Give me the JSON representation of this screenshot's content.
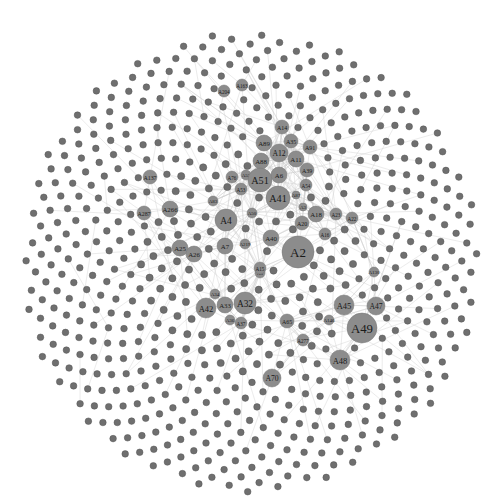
{
  "graph": {
    "type": "network",
    "background": "#ffffff",
    "node_color": "#8c8c8c",
    "small_node_color": "#6f6f6f",
    "edge_color": "#cfcfcf",
    "center": [
      250,
      262
    ],
    "outer_radius": 230,
    "labeled_nodes": [
      {
        "id": "A2",
        "x": 298,
        "y": 252,
        "r": 16
      },
      {
        "id": "A49",
        "x": 362,
        "y": 328,
        "r": 15
      },
      {
        "id": "A41",
        "x": 278,
        "y": 198,
        "r": 12
      },
      {
        "id": "A51",
        "x": 260,
        "y": 180,
        "r": 12
      },
      {
        "id": "A4",
        "x": 226,
        "y": 220,
        "r": 11
      },
      {
        "id": "A32",
        "x": 245,
        "y": 303,
        "r": 11
      },
      {
        "id": "A42",
        "x": 206,
        "y": 308,
        "r": 10
      },
      {
        "id": "A45",
        "x": 344,
        "y": 305,
        "r": 10
      },
      {
        "id": "A47",
        "x": 376,
        "y": 306,
        "r": 9
      },
      {
        "id": "A48",
        "x": 340,
        "y": 360,
        "r": 10
      },
      {
        "id": "A12",
        "x": 279,
        "y": 153,
        "r": 9
      },
      {
        "id": "A6",
        "x": 279,
        "y": 175,
        "r": 8
      },
      {
        "id": "A11",
        "x": 296,
        "y": 159,
        "r": 8
      },
      {
        "id": "A88",
        "x": 261,
        "y": 161,
        "r": 8
      },
      {
        "id": "A89",
        "x": 264,
        "y": 143,
        "r": 8
      },
      {
        "id": "A35",
        "x": 291,
        "y": 141,
        "r": 7
      },
      {
        "id": "A91",
        "x": 310,
        "y": 147,
        "r": 7
      },
      {
        "id": "A14",
        "x": 282,
        "y": 127,
        "r": 7
      },
      {
        "id": "A39",
        "x": 307,
        "y": 170,
        "r": 7
      },
      {
        "id": "A70",
        "x": 272,
        "y": 378,
        "r": 9
      },
      {
        "id": "A33",
        "x": 225,
        "y": 305,
        "r": 8
      },
      {
        "id": "A25",
        "x": 180,
        "y": 248,
        "r": 8
      },
      {
        "id": "A26",
        "x": 194,
        "y": 254,
        "r": 8
      },
      {
        "id": "A7",
        "x": 225,
        "y": 246,
        "r": 8
      },
      {
        "id": "A40",
        "x": 271,
        "y": 238,
        "r": 8
      },
      {
        "id": "A18",
        "x": 316,
        "y": 214,
        "r": 8
      },
      {
        "id": "A20",
        "x": 302,
        "y": 223,
        "r": 7
      },
      {
        "id": "A23",
        "x": 336,
        "y": 214,
        "r": 6
      },
      {
        "id": "A22",
        "x": 352,
        "y": 218,
        "r": 6
      },
      {
        "id": "A16",
        "x": 325,
        "y": 234,
        "r": 6
      },
      {
        "id": "A15",
        "x": 260,
        "y": 268,
        "r": 6
      },
      {
        "id": "A5",
        "x": 260,
        "y": 273,
        "r": 5
      },
      {
        "id": "A53",
        "x": 241,
        "y": 189,
        "r": 6
      },
      {
        "id": "A76",
        "x": 232,
        "y": 177,
        "r": 6
      },
      {
        "id": "A52",
        "x": 246,
        "y": 175,
        "r": 5
      },
      {
        "id": "A54",
        "x": 306,
        "y": 185,
        "r": 6
      },
      {
        "id": "A87",
        "x": 296,
        "y": 195,
        "r": 4
      },
      {
        "id": "A3",
        "x": 303,
        "y": 207,
        "r": 4
      },
      {
        "id": "A65",
        "x": 287,
        "y": 321,
        "r": 7
      },
      {
        "id": "A34",
        "x": 215,
        "y": 294,
        "r": 5
      },
      {
        "id": "A36",
        "x": 230,
        "y": 320,
        "r": 5
      },
      {
        "id": "A37",
        "x": 241,
        "y": 323,
        "r": 6
      },
      {
        "id": "A146",
        "x": 329,
        "y": 320,
        "r": 5
      },
      {
        "id": "A130",
        "x": 374,
        "y": 272,
        "r": 5
      },
      {
        "id": "A287",
        "x": 144,
        "y": 213,
        "r": 7
      },
      {
        "id": "A137",
        "x": 150,
        "y": 177,
        "r": 7
      },
      {
        "id": "A266",
        "x": 170,
        "y": 209,
        "r": 8
      },
      {
        "id": "A83",
        "x": 213,
        "y": 201,
        "r": 5
      },
      {
        "id": "A219",
        "x": 245,
        "y": 244,
        "r": 5
      },
      {
        "id": "A204",
        "x": 224,
        "y": 91,
        "r": 6
      },
      {
        "id": "A163",
        "x": 242,
        "y": 85,
        "r": 6
      },
      {
        "id": "A277",
        "x": 303,
        "y": 340,
        "r": 6
      },
      {
        "id": "A50",
        "x": 252,
        "y": 213,
        "r": 5
      }
    ],
    "small_node_count": 720
  }
}
